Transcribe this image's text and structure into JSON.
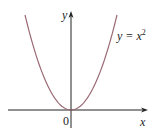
{
  "chart_data": {
    "type": "line",
    "title": "",
    "xlabel": "x",
    "ylabel": "y",
    "series": [
      {
        "name": "y = x^2",
        "label": "y = x",
        "exponent": "2",
        "x": [
          -2,
          -1.5,
          -1,
          -0.5,
          0,
          0.5,
          1,
          1.5,
          2
        ],
        "values": [
          4,
          2.25,
          1,
          0.25,
          0,
          0.25,
          1,
          2.25,
          4
        ]
      }
    ],
    "origin_label": "0",
    "grid": false,
    "legend": "none",
    "curve_color": "#9a6a74",
    "axis_color": "#222222"
  }
}
